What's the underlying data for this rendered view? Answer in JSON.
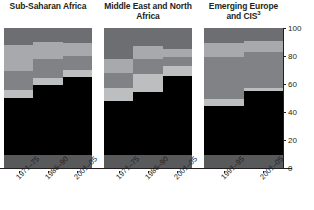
{
  "axis": {
    "ticks": [
      0,
      20,
      40,
      60,
      80,
      100
    ],
    "min": 0,
    "max": 100,
    "position": "right"
  },
  "colors": {
    "s1": "#58595b",
    "s2": "#000000",
    "s3": "#bcbec0",
    "s4": "#808285",
    "s5": "#a7a9ac",
    "s6": "#6d6e71",
    "axis": "#231f20",
    "background": "#ffffff"
  },
  "panels": [
    {
      "title": "Sub-Saharan Africa",
      "title_sup": "",
      "categories": [
        "1971–75",
        "1986–90",
        "2001–05"
      ],
      "bars": [
        {
          "label": "1971–75",
          "segments": [
            9,
            41,
            6,
            13,
            19,
            12
          ]
        },
        {
          "label": "1986–90",
          "segments": [
            9,
            50,
            5,
            14,
            12,
            10
          ]
        },
        {
          "label": "2001–05",
          "segments": [
            9,
            56,
            5,
            10,
            9,
            11
          ]
        }
      ]
    },
    {
      "title": "Middle East and North Africa",
      "title_sup": "",
      "categories": [
        "1971–75",
        "1986–90",
        "2001–05"
      ],
      "bars": [
        {
          "label": "1971–75",
          "segments": [
            9,
            39,
            9,
            11,
            10,
            22
          ]
        },
        {
          "label": "1986–90",
          "segments": [
            9,
            45,
            13,
            11,
            9,
            13
          ]
        },
        {
          "label": "2001–05",
          "segments": [
            9,
            57,
            7,
            6,
            6,
            15
          ]
        }
      ]
    },
    {
      "title": "Emerging Europe and CIS",
      "title_sup": "3",
      "categories": [
        "1991–95",
        "2001–05"
      ],
      "bars": [
        {
          "label": "1991–95",
          "segments": [
            9,
            35,
            5,
            30,
            10,
            11
          ]
        },
        {
          "label": "2001–05",
          "segments": [
            9,
            46,
            2,
            26,
            8,
            9
          ]
        }
      ]
    }
  ],
  "chart_data": {
    "type": "bar",
    "subtype": "stacked-100-percent",
    "title": "",
    "xlabel": "",
    "ylabel": "",
    "ylim": [
      0,
      100
    ],
    "yticks": [
      0,
      20,
      40,
      60,
      80,
      100
    ],
    "grid": false,
    "legend": "none",
    "orientation": "vertical",
    "panels": [
      {
        "name": "Sub-Saharan Africa",
        "categories": [
          "1971–75",
          "1986–90",
          "2001–05"
        ],
        "series": [
          {
            "name": "segment-1-dark-gray-base",
            "values": [
              9,
              9,
              9
            ]
          },
          {
            "name": "segment-2-black",
            "values": [
              41,
              50,
              56
            ]
          },
          {
            "name": "segment-3-light-gray",
            "values": [
              6,
              5,
              5
            ]
          },
          {
            "name": "segment-4-medium-gray",
            "values": [
              13,
              14,
              10
            ]
          },
          {
            "name": "segment-5-light-medium-gray",
            "values": [
              19,
              12,
              9
            ]
          },
          {
            "name": "segment-6-dark-gray-top",
            "values": [
              12,
              10,
              11
            ]
          }
        ]
      },
      {
        "name": "Middle East and North Africa",
        "categories": [
          "1971–75",
          "1986–90",
          "2001–05"
        ],
        "series": [
          {
            "name": "segment-1-dark-gray-base",
            "values": [
              9,
              9,
              9
            ]
          },
          {
            "name": "segment-2-black",
            "values": [
              39,
              45,
              57
            ]
          },
          {
            "name": "segment-3-light-gray",
            "values": [
              9,
              13,
              7
            ]
          },
          {
            "name": "segment-4-medium-gray",
            "values": [
              11,
              11,
              6
            ]
          },
          {
            "name": "segment-5-light-medium-gray",
            "values": [
              10,
              9,
              6
            ]
          },
          {
            "name": "segment-6-dark-gray-top",
            "values": [
              22,
              13,
              15
            ]
          }
        ]
      },
      {
        "name": "Emerging Europe and CIS3",
        "categories": [
          "1991–95",
          "2001–05"
        ],
        "series": [
          {
            "name": "segment-1-dark-gray-base",
            "values": [
              9,
              9
            ]
          },
          {
            "name": "segment-2-black",
            "values": [
              35,
              46
            ]
          },
          {
            "name": "segment-3-light-gray",
            "values": [
              5,
              2
            ]
          },
          {
            "name": "segment-4-medium-gray",
            "values": [
              30,
              26
            ]
          },
          {
            "name": "segment-5-light-medium-gray",
            "values": [
              10,
              8
            ]
          },
          {
            "name": "segment-6-dark-gray-top",
            "values": [
              11,
              9
            ]
          }
        ]
      }
    ]
  }
}
